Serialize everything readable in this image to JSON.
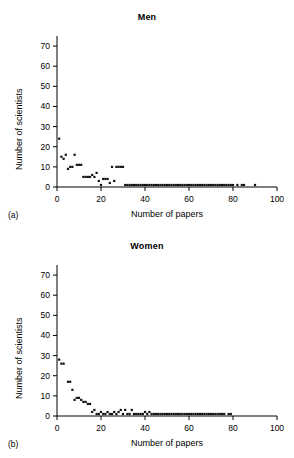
{
  "figure": {
    "background": "#ffffff",
    "ink": "#000000",
    "marker_color": "#111111"
  },
  "panels": [
    {
      "id": "men",
      "letter": "(a)",
      "title": "Men",
      "chart_data": {
        "type": "scatter",
        "title": "Men",
        "xlabel": "Number of papers",
        "ylabel": "Number of scientists",
        "xlim": [
          0,
          100
        ],
        "ylim": [
          0,
          75
        ],
        "xticks": [
          0,
          20,
          40,
          60,
          80,
          100
        ],
        "yticks": [
          0,
          10,
          20,
          30,
          40,
          50,
          60,
          70
        ],
        "grid": false,
        "legend": "none",
        "marker": "square",
        "x": [
          1,
          2,
          3,
          4,
          5,
          6,
          7,
          8,
          9,
          10,
          11,
          12,
          13,
          14,
          15,
          16,
          17,
          18,
          19,
          20,
          21,
          22,
          23,
          24,
          25,
          26,
          27,
          28,
          29,
          30,
          31,
          32,
          33,
          34,
          35,
          36,
          37,
          38,
          39,
          40,
          41,
          42,
          43,
          44,
          45,
          46,
          47,
          48,
          49,
          50,
          51,
          52,
          53,
          54,
          55,
          56,
          57,
          58,
          59,
          60,
          61,
          62,
          63,
          64,
          65,
          66,
          67,
          68,
          69,
          70,
          71,
          72,
          73,
          74,
          75,
          76,
          77,
          78,
          79,
          80,
          82,
          84,
          85,
          90
        ],
        "y": [
          24,
          15,
          14,
          16,
          9,
          10,
          10,
          16,
          11,
          11,
          11,
          5,
          5,
          5,
          5,
          6,
          5,
          7,
          3,
          1,
          4,
          4,
          4,
          2,
          10,
          3,
          10,
          10,
          10,
          10,
          1,
          1,
          1,
          1,
          1,
          1,
          1,
          1,
          1,
          1,
          1,
          1,
          1,
          1,
          1,
          1,
          1,
          1,
          1,
          1,
          1,
          1,
          1,
          1,
          1,
          1,
          1,
          1,
          1,
          1,
          1,
          1,
          1,
          1,
          1,
          1,
          1,
          1,
          1,
          1,
          1,
          1,
          1,
          1,
          1,
          1,
          1,
          1,
          1,
          1,
          1,
          1,
          1,
          1
        ]
      }
    },
    {
      "id": "women",
      "letter": "(b)",
      "title": "Women",
      "chart_data": {
        "type": "scatter",
        "title": "Women",
        "xlabel": "Number of papers",
        "ylabel": "Number of scientists",
        "xlim": [
          0,
          100
        ],
        "ylim": [
          0,
          75
        ],
        "xticks": [
          0,
          20,
          40,
          60,
          80,
          100
        ],
        "yticks": [
          0,
          10,
          20,
          30,
          40,
          50,
          60,
          70
        ],
        "grid": false,
        "legend": "none",
        "marker": "square",
        "x": [
          1,
          2,
          3,
          5,
          6,
          7,
          8,
          9,
          10,
          11,
          12,
          13,
          14,
          15,
          16,
          17,
          18,
          19,
          20,
          21,
          22,
          23,
          24,
          25,
          26,
          27,
          28,
          29,
          30,
          31,
          32,
          33,
          34,
          35,
          36,
          37,
          38,
          39,
          40,
          41,
          42,
          43,
          44,
          45,
          46,
          47,
          48,
          49,
          50,
          51,
          52,
          53,
          54,
          55,
          56,
          57,
          58,
          59,
          60,
          61,
          62,
          63,
          64,
          65,
          66,
          67,
          68,
          69,
          70,
          71,
          72,
          73,
          74,
          75,
          76,
          78,
          79
        ],
        "y": [
          28,
          26,
          26,
          17,
          17,
          13,
          8,
          9,
          9,
          8,
          7,
          7,
          6,
          6,
          2,
          3,
          1,
          1,
          2,
          1,
          1,
          2,
          1,
          1,
          2,
          1,
          2,
          3,
          1,
          3,
          1,
          1,
          3,
          1,
          1,
          1,
          1,
          1,
          2,
          1,
          2,
          1,
          1,
          1,
          1,
          1,
          1,
          1,
          1,
          1,
          1,
          1,
          1,
          1,
          1,
          1,
          1,
          1,
          1,
          1,
          1,
          1,
          1,
          1,
          1,
          1,
          1,
          1,
          1,
          1,
          1,
          1,
          1,
          1,
          1,
          1,
          1
        ]
      }
    }
  ]
}
